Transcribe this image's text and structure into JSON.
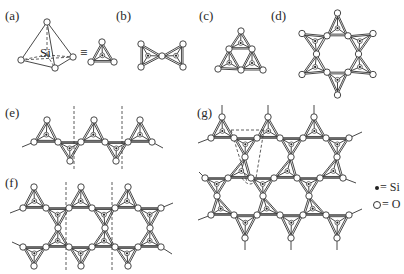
{
  "figure": {
    "panel_labels": [
      {
        "id": "a",
        "text": "(a)",
        "x": 5,
        "y": 9
      },
      {
        "id": "b",
        "text": "(b)",
        "x": 116,
        "y": 9
      },
      {
        "id": "c",
        "text": "(c)",
        "x": 199,
        "y": 9
      },
      {
        "id": "d",
        "text": "(d)",
        "x": 271,
        "y": 9
      },
      {
        "id": "e",
        "text": "(e)",
        "x": 5,
        "y": 106
      },
      {
        "id": "f",
        "text": "(f)",
        "x": 5,
        "y": 176
      },
      {
        "id": "g",
        "text": "(g)",
        "x": 197,
        "y": 106
      }
    ],
    "panel_a": {
      "si_label": "Si",
      "equivalence_symbol": "≡"
    },
    "legend": {
      "si": {
        "symbol": "filled-dot",
        "text": "= Si"
      },
      "o": {
        "symbol": "open-circle",
        "text": "= O"
      }
    },
    "descriptions": {
      "a": "SiO4 tetrahedron (3D perspective) equivalent to planar tetrahedron symbol",
      "b": "Two corner-sharing tetrahedra (Si2O7)",
      "c": "Three-membered ring (Si3O9)",
      "d": "Six-membered ring (Si6O18)",
      "e": "Single chain of tetrahedra (pyroxene), repeat unit between dashed lines",
      "f": "Double chain of tetrahedra (amphibole), repeat unit between dashed lines",
      "g": "Sheet of tetrahedra (layer silicate), unit cell outlined by dashed lines"
    },
    "colors": {
      "ink": "#333333",
      "paper": "#ffffff"
    }
  }
}
